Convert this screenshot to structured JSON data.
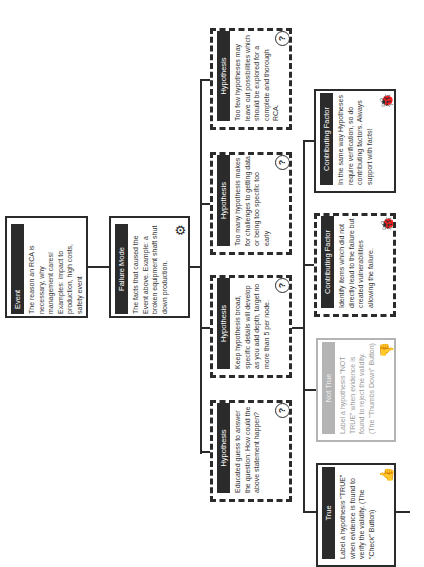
{
  "diagram": {
    "event": {
      "title": "Event",
      "text": "The reason an RCA is necessary, why management cares! Examples: impact to production, high costs, safety event",
      "icon": "warning-triangle-icon"
    },
    "failure_mode": {
      "title": "Failure Mode",
      "text": "The facts that caused the Event above. Example: a broken equipment shaft shut down production.",
      "icon": "gear-icon"
    },
    "hypotheses": [
      {
        "title": "Hypothesis",
        "text": "Too few hypotheses may leave out possibilities which should be explored for a complete and thorough RCA.",
        "icon": "question-icon"
      },
      {
        "title": "Hypothesis",
        "text": "Too many hypothesis makes for challenges to getting data or being too specific too early",
        "icon": "question-icon"
      },
      {
        "title": "Hypothesis",
        "text": "Keep hypothesis broad, specific details will develop as you add depth, target no more than 5 per node.",
        "icon": "question-icon"
      },
      {
        "title": "Hypothesis",
        "text": "Educated guess to answer the question: How could the above statement happen?",
        "icon": "question-icon"
      }
    ],
    "contributing_factors": [
      {
        "title": "Contributing Factor",
        "text": "In the same way Hypotheses require verification, so do contributing factors. Always support with facts!",
        "icon": "bug-icon"
      },
      {
        "title": "Contributing Factor",
        "text": "Identify items which did not directly lead to the failure but created vulnerabilities allowing the failure.",
        "icon": "bug-icon"
      }
    ],
    "not_true": {
      "title": "Not True",
      "text": "Label a hypothesis \"NOT TRUE\" when evidence is found to reject the validity. (The \"Thumbs Down\" Button)",
      "icon": "thumbs-down-icon"
    },
    "true": {
      "title": "True",
      "text": "Label a hypothesis \"TRUE\" when evidence is found to verify the validity. (The \"Check\" Button)",
      "icon": "thumbs-up-icon"
    },
    "colors": {
      "dark": "#2b2b2b",
      "muted": "#b4b4b4",
      "background": "#ffffff"
    }
  }
}
